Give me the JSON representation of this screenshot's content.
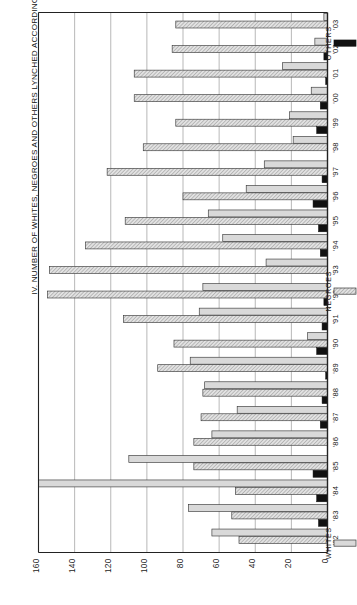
{
  "figure": {
    "title": "IV. NUMBER OF WHITES, NEGROES AND OTHERS LYNCHED ACCORDING TO YEARS 1882-1903"
  },
  "legend": {
    "whites_label": "WHITES",
    "negroes_label": "NEGROES",
    "others_label": "OTHERS"
  },
  "colors": {
    "whites": "#d9d9d9",
    "negroes": "#cccccc",
    "others": "#111111",
    "outline": "#3a3a3a",
    "grid": "#9a9a9a",
    "axis": "#222222",
    "text": "#1a1a1a",
    "background": "#ffffff"
  },
  "chart_data": {
    "type": "bar",
    "orientation": "horizontal",
    "title": "IV. NUMBER OF WHITES, NEGROES AND OTHERS LYNCHED ACCORDING TO YEARS 1882-1903",
    "xlabel": "",
    "ylabel": "",
    "xlim": [
      0,
      160
    ],
    "xticks": [
      0,
      20,
      40,
      60,
      80,
      100,
      120,
      140,
      160
    ],
    "xtick_labels": [
      "0",
      "20",
      "40",
      "60",
      "80",
      "100",
      "120",
      "140",
      "160"
    ],
    "grid": true,
    "axis_direction": "value axis increases right-to-left; 0 at right edge",
    "legend_position": "right",
    "categories": [
      "'82",
      "'83",
      "'84",
      "'85",
      "'86",
      "'87",
      "'88",
      "'89",
      "'90",
      "'91",
      "'92",
      "'93",
      "'94",
      "'95",
      "'96",
      "'97",
      "'98",
      "'99",
      "'00",
      "'01",
      "'02",
      "'03"
    ],
    "category_full": [
      "1882",
      "1883",
      "1884",
      "1885",
      "1886",
      "1887",
      "1888",
      "1889",
      "1890",
      "1891",
      "1892",
      "1893",
      "1894",
      "1895",
      "1896",
      "1897",
      "1898",
      "1899",
      "1900",
      "1901",
      "1902",
      "1903"
    ],
    "series": [
      {
        "name": "WHITES",
        "color": "#d9d9d9",
        "values": [
          64,
          77,
          160,
          110,
          64,
          50,
          68,
          76,
          11,
          71,
          69,
          34,
          58,
          66,
          45,
          35,
          19,
          21,
          9,
          25,
          7,
          2
        ]
      },
      {
        "name": "NEGROES",
        "color": "#cccccc",
        "values": [
          49,
          53,
          51,
          74,
          74,
          70,
          69,
          94,
          85,
          113,
          155,
          154,
          134,
          112,
          80,
          122,
          102,
          84,
          107,
          107,
          86,
          84
        ]
      },
      {
        "name": "OTHERS",
        "color": "#111111",
        "values": [
          0,
          5,
          6,
          8,
          0,
          4,
          3,
          1,
          6,
          3,
          2,
          0,
          4,
          5,
          8,
          3,
          0,
          6,
          4,
          1,
          2,
          0
        ]
      }
    ]
  }
}
